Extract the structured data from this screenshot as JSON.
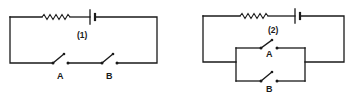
{
  "diagram": {
    "type": "circuit-schematics",
    "circuits": [
      {
        "id": "circuit-1",
        "label": "(1)",
        "components": [
          "resistor",
          "battery",
          "switch A",
          "switch B"
        ],
        "switch_arrangement": "series",
        "switches": [
          {
            "label": "A"
          },
          {
            "label": "B"
          }
        ]
      },
      {
        "id": "circuit-2",
        "label": "(2)",
        "components": [
          "resistor",
          "battery",
          "switch A",
          "switch B"
        ],
        "switch_arrangement": "parallel",
        "switches": [
          {
            "label": "A"
          },
          {
            "label": "B"
          }
        ]
      }
    ],
    "colors": {
      "line": "#1a1a1a",
      "background": "#ffffff"
    }
  }
}
